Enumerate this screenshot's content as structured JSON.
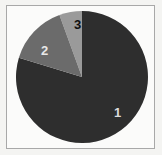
{
  "figure": {
    "background_color": "#f4f4f2",
    "frame_color": "#a8a8a8",
    "plot_background": "#fbfbfa",
    "width": 162,
    "height": 155
  },
  "chart_data": {
    "type": "pie",
    "title": "",
    "subtitle": "",
    "xlabel": "",
    "ylabel": "",
    "grid": false,
    "legend": "none",
    "labels_position": "inside-slices",
    "start_angle_deg": 0,
    "direction": "clockwise",
    "center": {
      "x": 82,
      "y": 77
    },
    "radius": 66,
    "categories": [
      "1",
      "2",
      "3"
    ],
    "values": [
      79.7,
      14.7,
      5.6
    ],
    "value_unit": "percent",
    "angles_deg": [
      287,
      53,
      20
    ],
    "colors": [
      "#2e2e2e",
      "#6b6b6b",
      "#9a9a9a"
    ],
    "slices": [
      {
        "label": "1",
        "value": 79.7,
        "angle_deg": 287,
        "color": "#2e2e2e",
        "label_color": "#dcdcdc",
        "label_x": 118,
        "label_y": 112
      },
      {
        "label": "2",
        "value": 14.7,
        "angle_deg": 53,
        "color": "#6b6b6b",
        "label_color": "#e8e8e8",
        "label_x": 45,
        "label_y": 50
      },
      {
        "label": "3",
        "value": 5.6,
        "angle_deg": 20,
        "color": "#9a9a9a",
        "label_color": "#101010",
        "label_x": 78,
        "label_y": 24
      }
    ]
  }
}
